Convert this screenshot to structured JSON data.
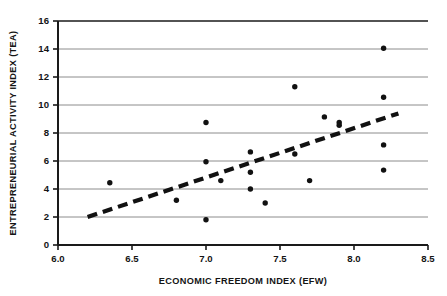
{
  "chart_data": {
    "type": "scatter",
    "title": "",
    "xlabel": "ECONOMIC FREEDOM INDEX (EFW)",
    "ylabel": "ENTREPRENEURIAL ACTIVITY INDEX (TEA)",
    "xlim": [
      6.0,
      8.5
    ],
    "ylim": [
      0,
      16
    ],
    "xticks": [
      "6.0",
      "6.5",
      "7.0",
      "7.5",
      "8.0",
      "8.5"
    ],
    "xtick_values": [
      6.0,
      6.5,
      7.0,
      7.5,
      8.0,
      8.5
    ],
    "yticks": [
      "0",
      "2",
      "4",
      "6",
      "8",
      "10",
      "12",
      "14",
      "16"
    ],
    "ytick_values": [
      0,
      2,
      4,
      6,
      8,
      10,
      12,
      14,
      16
    ],
    "grid": "horizontal",
    "legend": "none",
    "marker_color": "#111111",
    "grid_color": "#8c8c8c",
    "axis_color": "#1a1a1a",
    "trendline_color": "#111111",
    "points": [
      {
        "x": 6.35,
        "y": 4.45
      },
      {
        "x": 6.8,
        "y": 3.2
      },
      {
        "x": 7.0,
        "y": 8.75
      },
      {
        "x": 7.0,
        "y": 5.95
      },
      {
        "x": 7.0,
        "y": 1.8
      },
      {
        "x": 7.1,
        "y": 4.6
      },
      {
        "x": 7.3,
        "y": 6.65
      },
      {
        "x": 7.3,
        "y": 5.2
      },
      {
        "x": 7.3,
        "y": 4.0
      },
      {
        "x": 7.4,
        "y": 3.0
      },
      {
        "x": 7.6,
        "y": 11.3
      },
      {
        "x": 7.6,
        "y": 6.5
      },
      {
        "x": 7.7,
        "y": 4.6
      },
      {
        "x": 7.8,
        "y": 9.15
      },
      {
        "x": 7.9,
        "y": 8.75
      },
      {
        "x": 7.9,
        "y": 8.55
      },
      {
        "x": 8.2,
        "y": 14.05
      },
      {
        "x": 8.2,
        "y": 10.55
      },
      {
        "x": 8.2,
        "y": 7.15
      },
      {
        "x": 8.2,
        "y": 5.35
      }
    ],
    "trendline": {
      "style": "dashed",
      "x_start": 6.2,
      "y_start": 2.0,
      "x_end": 8.3,
      "y_end": 9.4
    }
  }
}
